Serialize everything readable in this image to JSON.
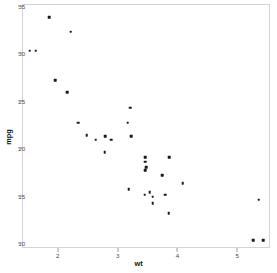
{
  "chart_data": {
    "type": "scatter",
    "title": "",
    "xlabel": "wt",
    "ylabel": "mpg",
    "xlim": [
      1.4,
      5.55
    ],
    "ylim": [
      9.5,
      35.2
    ],
    "xticks": [
      2,
      3,
      4,
      5
    ],
    "yticks": [
      10,
      15,
      20,
      25,
      30,
      35
    ],
    "xtick_labels": [
      "2",
      "3",
      "4",
      "5"
    ],
    "ytick_labels": [
      "10",
      "15",
      "20",
      "25",
      "30",
      "35"
    ],
    "grid": false,
    "legend": "none",
    "point_color": "#1a1a1a",
    "panel_border_color": "#d4d4d4",
    "background_color": "#ffffff",
    "x": [
      2.62,
      2.875,
      2.32,
      3.215,
      3.44,
      3.46,
      3.57,
      3.19,
      3.15,
      3.44,
      3.44,
      4.07,
      3.73,
      3.78,
      5.25,
      5.424,
      5.345,
      2.2,
      1.615,
      1.835,
      2.465,
      3.52,
      3.435,
      3.84,
      3.845,
      1.935,
      2.14,
      1.513,
      3.17,
      2.77,
      3.57,
      2.78
    ],
    "y": [
      21.0,
      21.0,
      22.8,
      21.4,
      18.7,
      18.1,
      14.3,
      24.4,
      22.8,
      19.2,
      17.8,
      16.4,
      17.3,
      15.2,
      10.4,
      10.4,
      14.7,
      32.4,
      30.4,
      33.9,
      21.5,
      15.5,
      15.2,
      13.3,
      19.2,
      27.3,
      26.0,
      30.4,
      15.8,
      19.7,
      15.0,
      21.4
    ],
    "n_points": 32
  }
}
